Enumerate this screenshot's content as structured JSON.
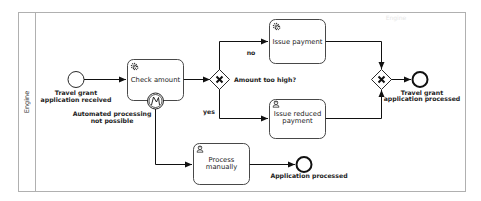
{
  "pool": {
    "lane_label": "Engine",
    "header_watermark": "Engine"
  },
  "events": {
    "start": {
      "label_line1": "Travel grant",
      "label_line2": "application received"
    },
    "end_processed": {
      "label_line1": "Travel grant",
      "label_line2": "application processed"
    },
    "end_manual": {
      "label": "Application processed"
    },
    "boundary_error": {
      "label_line1": "Automated processing",
      "label_line2": "not possible",
      "icon": "error-icon"
    }
  },
  "tasks": {
    "check_amount": {
      "label": "Check amount",
      "type_icon": "gear-icon"
    },
    "issue_payment": {
      "label": "Issue payment",
      "type_icon": "gear-icon"
    },
    "issue_reduced_payment": {
      "label_line1": "Issue reduced",
      "label_line2": "payment",
      "type_icon": "user-icon"
    },
    "process_manually": {
      "label_line1": "Process",
      "label_line2": "manually",
      "type_icon": "user-icon"
    }
  },
  "gateways": {
    "amount_check": {
      "label": "Amount too high?",
      "type": "exclusive",
      "icon": "x-icon"
    },
    "merge": {
      "type": "exclusive",
      "icon": "x-icon"
    }
  },
  "flows": {
    "no_label": "no",
    "yes_label": "yes"
  },
  "colors": {
    "stroke": "#111111",
    "pool_border": "#b0b0b0",
    "background": "#ffffff"
  }
}
